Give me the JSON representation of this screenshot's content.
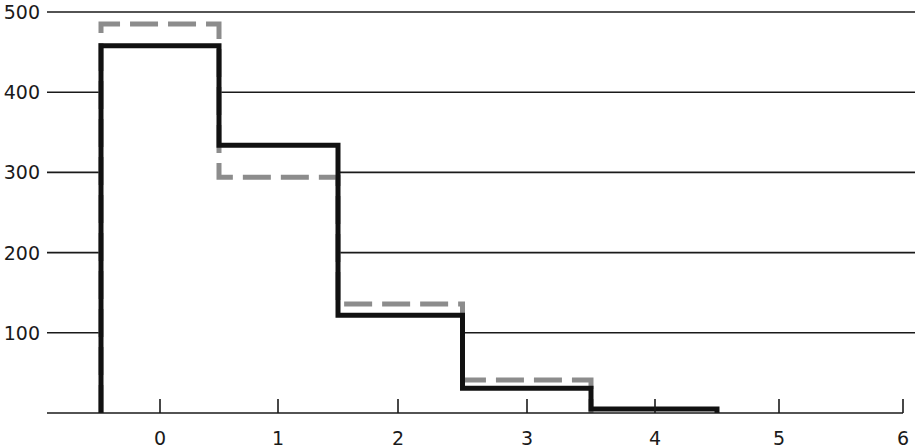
{
  "chart_data": {
    "type": "bar",
    "subtype": "step-histogram",
    "title": "",
    "xlabel": "",
    "ylabel": "",
    "x_ticks": [
      "0",
      "1",
      "2",
      "3",
      "4",
      "5",
      "6"
    ],
    "y_ticks": [
      "100",
      "200",
      "300",
      "400",
      "500"
    ],
    "xlim": [
      -0.9,
      6
    ],
    "ylim": [
      0,
      500
    ],
    "grid": "horizontal",
    "legend": null,
    "categories": [
      0,
      1,
      2,
      3,
      4
    ],
    "series": [
      {
        "name": "solid (black)",
        "style": "solid",
        "color": "#111111",
        "values": [
          458,
          334,
          122,
          31,
          5
        ]
      },
      {
        "name": "dashed (gray)",
        "style": "dashed",
        "color": "#8c8c8c",
        "values": [
          485,
          294,
          136,
          41,
          null
        ]
      }
    ]
  }
}
